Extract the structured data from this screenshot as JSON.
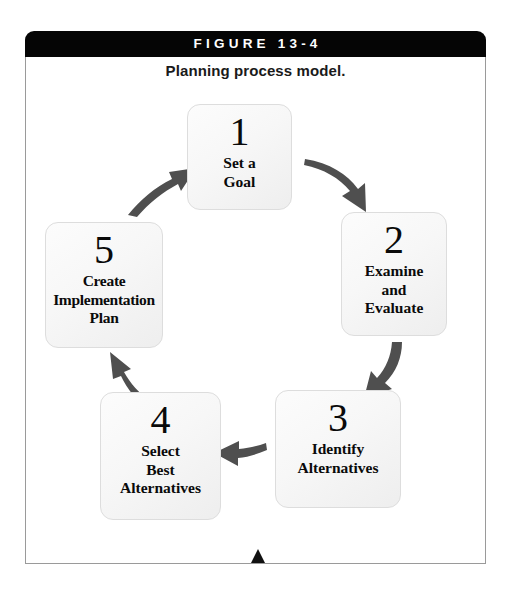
{
  "figure": {
    "header_label": "FIGURE 13-4",
    "caption": "Planning process model.",
    "header_bg": "#050505",
    "header_text_color": "#ffffff",
    "frame_border_color": "#9a9a9a",
    "arrow_color": "#4f4f4f",
    "box_border_color": "#dddddd",
    "box_fill": "#f7f7f7",
    "marker_color": "#111111"
  },
  "diagram_data": {
    "type": "cycle",
    "title": "Planning process model.",
    "direction": "clockwise",
    "steps": [
      {
        "number": "1",
        "lines": [
          "Set a",
          "Goal"
        ]
      },
      {
        "number": "2",
        "lines": [
          "Examine",
          "and",
          "Evaluate"
        ]
      },
      {
        "number": "3",
        "lines": [
          "Identify",
          "Alternatives"
        ]
      },
      {
        "number": "4",
        "lines": [
          "Select",
          "Best",
          "Alternatives"
        ]
      },
      {
        "number": "5",
        "lines": [
          "Create",
          "Implementation",
          "Plan"
        ]
      }
    ],
    "connections": [
      {
        "from": "1",
        "to": "2",
        "style": "curved-arrow"
      },
      {
        "from": "2",
        "to": "3",
        "style": "curved-arrow"
      },
      {
        "from": "3",
        "to": "4",
        "style": "curved-arrow"
      },
      {
        "from": "4",
        "to": "5",
        "style": "curved-arrow"
      },
      {
        "from": "5",
        "to": "1",
        "style": "curved-arrow"
      }
    ]
  },
  "steps": {
    "s1": {
      "number": "1",
      "l1": "Set a",
      "l2": "Goal",
      "l3": ""
    },
    "s2": {
      "number": "2",
      "l1": "Examine",
      "l2": "and",
      "l3": "Evaluate"
    },
    "s3": {
      "number": "3",
      "l1": "Identify",
      "l2": "Alternatives",
      "l3": ""
    },
    "s4": {
      "number": "4",
      "l1": "Select",
      "l2": "Best",
      "l3": "Alternatives"
    },
    "s5": {
      "number": "5",
      "l1": "Create",
      "l2": "Implementation",
      "l3": "Plan"
    }
  }
}
